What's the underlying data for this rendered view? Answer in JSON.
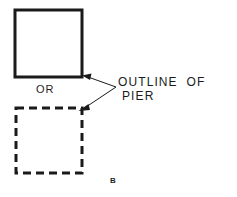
{
  "figure": {
    "id_label": "B",
    "background_color": "#ffffff",
    "ink_color": "#1a1a1a"
  },
  "shapes": {
    "solid_square": {
      "name": "pier-outline-solid",
      "style": "solid",
      "x": 15,
      "y": 10,
      "width": 67,
      "height": 67,
      "stroke_width": 3
    },
    "dashed_square": {
      "name": "pier-outline-dashed",
      "style": "dashed",
      "x": 16,
      "y": 108,
      "width": 66,
      "height": 65,
      "stroke_width": 3,
      "dash": "8 5"
    }
  },
  "leader": {
    "vertex_x": 116,
    "vertex_y": 87,
    "arrow_upper_x": 84,
    "arrow_upper_y": 76,
    "arrow_lower_x": 81,
    "arrow_lower_y": 110,
    "stroke_width": 1
  },
  "labels": {
    "or": "OR",
    "annotation_line_1": "OUTLINE  OF",
    "annotation_line_2": "PIER"
  }
}
